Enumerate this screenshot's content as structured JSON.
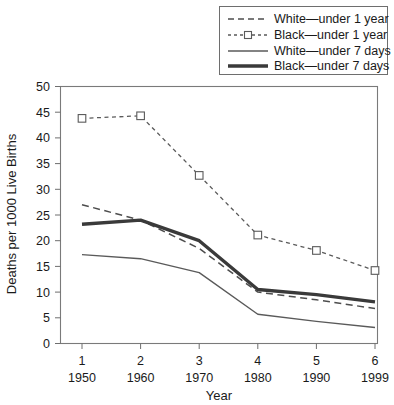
{
  "chart_data": {
    "type": "line",
    "title": "",
    "xlabel": "Year",
    "ylabel": "Deaths per 1000 Live Births",
    "categories": [
      "1",
      "2",
      "3",
      "4",
      "5",
      "6"
    ],
    "x_tick_years": [
      "1950",
      "1960",
      "1970",
      "1980",
      "1990",
      "1999"
    ],
    "x_index": [
      1,
      2,
      3,
      4,
      5,
      6
    ],
    "ylim": [
      0,
      50
    ],
    "y_ticks": [
      0,
      5,
      10,
      15,
      20,
      25,
      30,
      35,
      40,
      45,
      50
    ],
    "grid": false,
    "legend_position": "top-right",
    "series": [
      {
        "name": "White—under 1 year",
        "style": "dashed",
        "markers": false,
        "color": "#4d4d4d",
        "values": [
          27.0,
          24.0,
          18.5,
          10.0,
          8.5,
          6.8
        ]
      },
      {
        "name": "Black—under 1 year",
        "style": "dotted-dashed-with-square-markers",
        "markers": true,
        "color": "#5a5a5a",
        "values": [
          43.8,
          44.3,
          32.7,
          21.1,
          18.1,
          14.2
        ]
      },
      {
        "name": "White—under 7 days",
        "style": "solid-thin",
        "markers": false,
        "color": "#5a5a5a",
        "values": [
          17.3,
          16.5,
          13.8,
          5.7,
          4.3,
          3.1
        ]
      },
      {
        "name": "Black—under 7 days",
        "style": "solid-thick",
        "markers": false,
        "color": "#3a3a3a",
        "values": [
          23.2,
          24.0,
          20.0,
          10.5,
          9.5,
          8.1
        ]
      }
    ]
  },
  "legend": {
    "entries": [
      {
        "label": "White—under 1 year"
      },
      {
        "label": "Black—under 1 year"
      },
      {
        "label": "White—under 7 days"
      },
      {
        "label": "Black—under 7 days"
      }
    ]
  },
  "axes": {
    "y_title": "Deaths per 1000 Live Births",
    "x_title": "Year"
  }
}
